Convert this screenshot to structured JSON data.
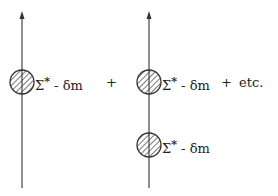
{
  "diagram": {
    "terms": [
      {
        "line_x": 22,
        "insertions": [
          {
            "cy": 82,
            "label_symbol": "Σ",
            "label_sup": "*",
            "label_rest": " - δm"
          }
        ]
      },
      {
        "line_x": 149,
        "insertions": [
          {
            "cy": 82,
            "label_symbol": "Σ",
            "label_sup": "*",
            "label_rest": " - δm"
          },
          {
            "cy": 145,
            "label_symbol": "Σ",
            "label_sup": "*",
            "label_rest": " - δm"
          }
        ]
      }
    ],
    "operators": [
      {
        "text": "+",
        "x": 105,
        "y": 76
      },
      {
        "text": "+",
        "x": 221,
        "y": 76
      }
    ],
    "trailing": {
      "text": "etc.",
      "x": 240,
      "y": 76
    },
    "colors": {
      "line": "#444444",
      "hatch": "#333333"
    }
  }
}
